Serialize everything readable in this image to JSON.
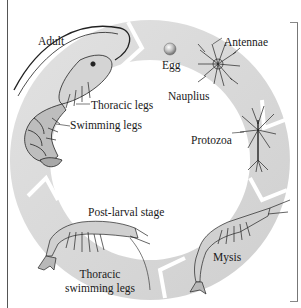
{
  "diagram": {
    "ring_color": "#d9d9d9",
    "stages": [
      {
        "id": "egg",
        "label": "Egg"
      },
      {
        "id": "nauplius",
        "label": "Nauplius"
      },
      {
        "id": "protozoa",
        "label": "Protozoa"
      },
      {
        "id": "mysis",
        "label": "Mysis"
      },
      {
        "id": "post-larval",
        "label": "Post-larval stage"
      },
      {
        "id": "adult",
        "label": "Adult"
      }
    ],
    "annotations": {
      "antennae": "Antennae",
      "thoracic_legs": "Thoracic legs",
      "swimming_legs": "Swimming legs",
      "thoracic_swimming_legs_line1": "Thoracic",
      "thoracic_swimming_legs_line2": "swimming legs"
    }
  }
}
